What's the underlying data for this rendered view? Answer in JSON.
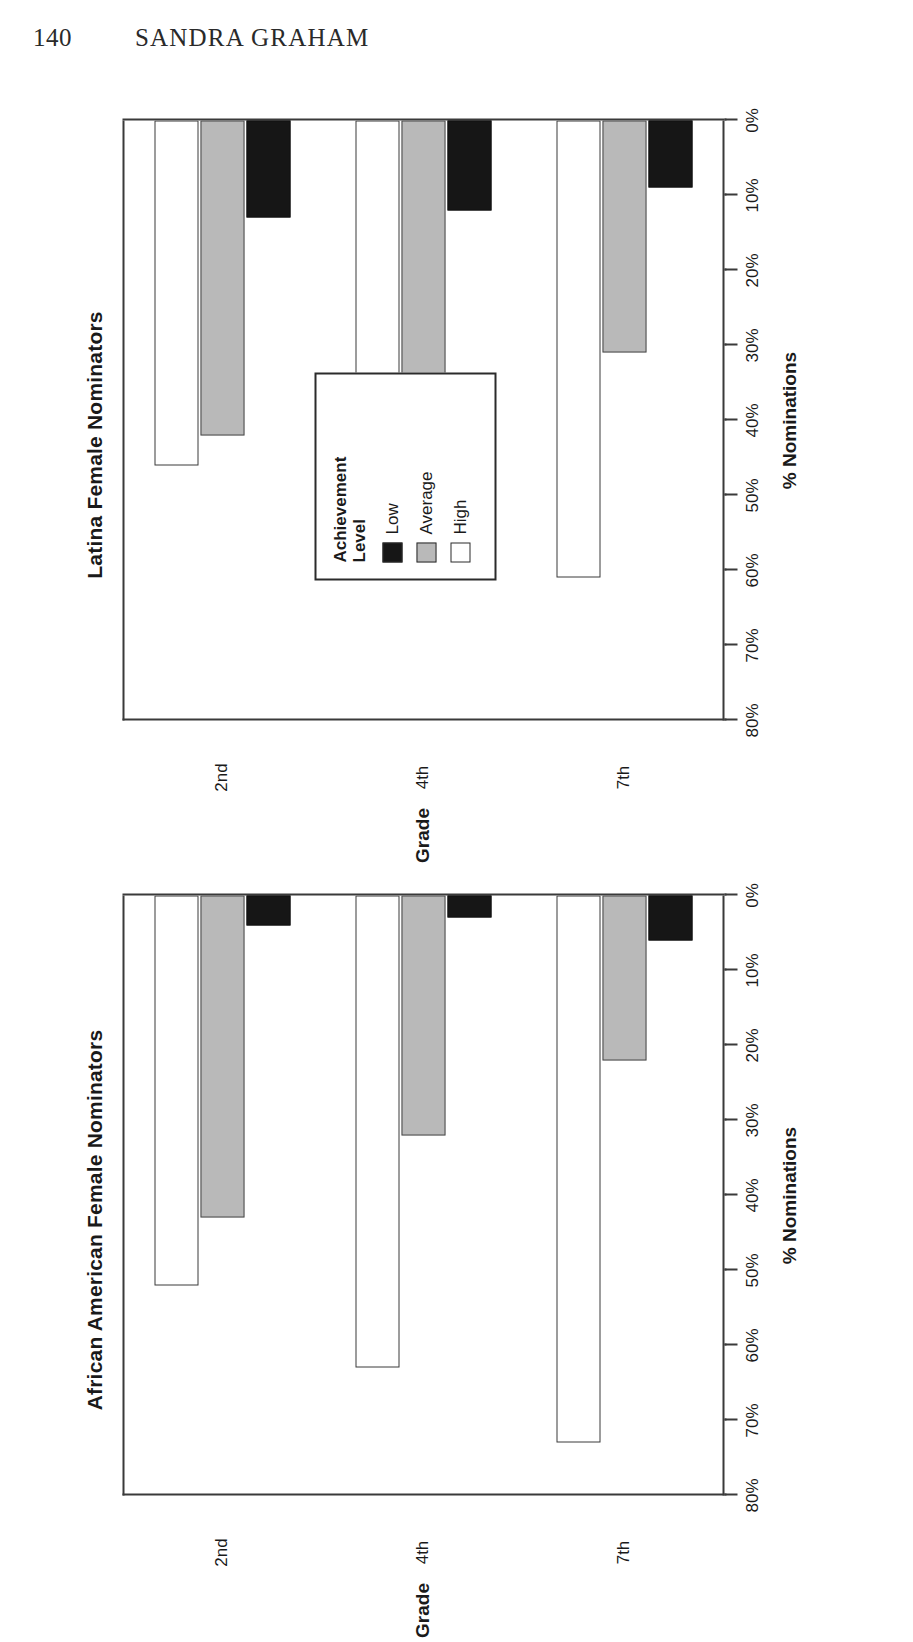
{
  "page": {
    "number": "140",
    "running_head": "SANDRA GRAHAM"
  },
  "legend": {
    "title_line1": "Achievement",
    "title_line2": "Level",
    "entries": [
      {
        "label": "Low",
        "swatch": "black",
        "color": "#161616"
      },
      {
        "label": "Average",
        "swatch": "gray",
        "color": "#b9b9b9"
      },
      {
        "label": "High",
        "swatch": "white",
        "color": "#ffffff"
      }
    ]
  },
  "axis": {
    "value_title": "% Nominations",
    "category_title": "Grade",
    "ticks": [
      "80%",
      "70%",
      "60%",
      "50%",
      "40%",
      "30%",
      "20%",
      "10%",
      "0%"
    ],
    "tick_values": [
      80,
      70,
      60,
      50,
      40,
      30,
      20,
      10,
      0
    ],
    "categories": [
      "2nd",
      "4th",
      "7th"
    ]
  },
  "charts": [
    {
      "id": "latina",
      "title": "Latina Female Nominators",
      "has_legend": true
    },
    {
      "id": "african-american",
      "title": "African American Female Nominators",
      "has_legend": false
    }
  ],
  "chart_data": [
    {
      "type": "bar",
      "orientation": "horizontal",
      "title": "Latina Female Nominators",
      "xlabel": "Grade",
      "ylabel": "% Nominations",
      "categories": [
        "2nd",
        "4th",
        "7th"
      ],
      "ylim": [
        0,
        80
      ],
      "yticks": [
        0,
        10,
        20,
        30,
        40,
        50,
        60,
        70,
        80
      ],
      "ytick_labels": [
        "0%",
        "10%",
        "20%",
        "30%",
        "40%",
        "50%",
        "60%",
        "70%",
        "80%"
      ],
      "grid": false,
      "legend": "Achievement Level",
      "legend_position": "inside-upper-middle",
      "series": [
        {
          "name": "Low",
          "color": "#161616",
          "values": [
            13,
            12,
            9
          ]
        },
        {
          "name": "Average",
          "color": "#b9b9b9",
          "values": [
            42,
            46,
            31
          ]
        },
        {
          "name": "High",
          "color": "#ffffff",
          "values": [
            46,
            46,
            61
          ]
        }
      ]
    },
    {
      "type": "bar",
      "orientation": "horizontal",
      "title": "African American Female Nominators",
      "xlabel": "Grade",
      "ylabel": "% Nominations",
      "categories": [
        "2nd",
        "4th",
        "7th"
      ],
      "ylim": [
        0,
        80
      ],
      "yticks": [
        0,
        10,
        20,
        30,
        40,
        50,
        60,
        70,
        80
      ],
      "ytick_labels": [
        "0%",
        "10%",
        "20%",
        "30%",
        "40%",
        "50%",
        "60%",
        "70%",
        "80%"
      ],
      "grid": false,
      "legend": "Achievement Level",
      "legend_position": "none",
      "series": [
        {
          "name": "Low",
          "color": "#161616",
          "values": [
            4,
            3,
            6
          ]
        },
        {
          "name": "Average",
          "color": "#b9b9b9",
          "values": [
            43,
            32,
            22
          ]
        },
        {
          "name": "High",
          "color": "#ffffff",
          "values": [
            52,
            63,
            73
          ]
        }
      ]
    }
  ]
}
